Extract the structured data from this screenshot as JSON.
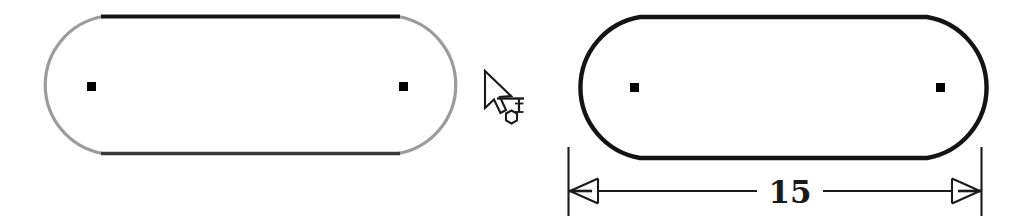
{
  "canvas": {
    "width": 1030,
    "height": 223,
    "background_color": "#ffffff",
    "title": "Slot shape preview and dimensioned result"
  },
  "colors": {
    "outline_black": "#141414",
    "outline_gray": "#9b9b9b",
    "edge_dark_gray": "#3a3a3a",
    "marker_black": "#000000",
    "dimension_line": "#1a1a1a",
    "cursor_outline": "#1a1a1a",
    "cursor_fill": "#ffffff",
    "background": "#ffffff"
  },
  "left_figure": {
    "name": "slot-shape-preview",
    "state_label": "preview",
    "geometry": {
      "x": 33,
      "y": 15,
      "width": 435,
      "height": 140,
      "corner_radius": 70
    },
    "arc_stroke_color": "#9b9b9b",
    "top_edge_color": "#141414",
    "bottom_edge_color": "#3a3a3a",
    "stroke_width": 3,
    "center_markers": [
      {
        "name": "center-marker-left",
        "x": 91,
        "y": 86,
        "size": 9
      },
      {
        "name": "center-marker-right",
        "x": 403,
        "y": 86,
        "size": 9
      }
    ]
  },
  "right_figure": {
    "name": "slot-shape-dimensioned",
    "state_label": "dimensioned",
    "geometry": {
      "x": 567,
      "y": 15,
      "width": 433,
      "height": 145,
      "corner_radius": 72
    },
    "outline_color": "#141414",
    "stroke_width": 4,
    "center_markers": [
      {
        "name": "center-marker-left",
        "x": 634,
        "y": 87,
        "size": 9
      },
      {
        "name": "center-marker-right",
        "x": 940,
        "y": 87,
        "size": 9
      }
    ]
  },
  "dimension": {
    "name": "length-dimension",
    "value_label": "15",
    "units": "",
    "line_y": 191,
    "extension_lines": [
      {
        "name": "extension-line-left",
        "x": 568,
        "y_top": 147,
        "y_bottom": 216
      },
      {
        "name": "extension-line-right",
        "x": 982,
        "y_top": 147,
        "y_bottom": 216
      }
    ],
    "arrow_style": "open-outward",
    "arrowheads": [
      {
        "name": "dimension-arrow-left",
        "tip_x": 568,
        "y": 191,
        "direction": "left"
      },
      {
        "name": "dimension-arrow-right",
        "tip_x": 982,
        "y": 191,
        "direction": "right"
      }
    ],
    "label_x": 790,
    "label_y": 203,
    "text_gap": {
      "x_start": 757,
      "x_end": 823
    }
  },
  "cursor": {
    "name": "measure-tool-cursor",
    "pointer_tip": {
      "x": 485,
      "y": 71
    },
    "pointer_icon": "arrow-pointer-icon",
    "tool_icon": "dimension-measure-tool-icon",
    "tool_icon_origin": {
      "x": 497,
      "y": 96
    },
    "tool_glyph_parts": [
      "horizontal-baseline",
      "vertical-tick-with-serifs",
      "hexagon-node"
    ]
  }
}
